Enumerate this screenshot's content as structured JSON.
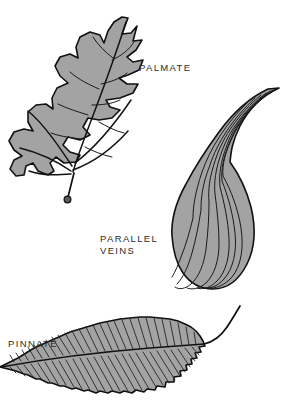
{
  "figure": {
    "width": 284,
    "height": 409,
    "background_color": "#ffffff"
  },
  "colors": {
    "leaf_fill": "#a3a3a3",
    "outline": "#111111",
    "vein": "#1a1a1a",
    "label_text": "#2b2b2b"
  },
  "labels": {
    "palmate": "PALMATE",
    "parallel": "PARALLEL\nVEINS",
    "pinnate": "PINNATE"
  },
  "diagrams": [
    {
      "id": "palmate-leaf",
      "label": "PALMATE",
      "description": "Lobed oak-like leaf with veins radiating from the petiole base into each lobe",
      "margin": "deeply lobed",
      "lobe_count": 9,
      "has_petiole": true
    },
    {
      "id": "parallel-veins-leaf",
      "label": "PARALLEL VEINS",
      "description": "Long lanceolate blade with curved veins running parallel from base to tip",
      "margin": "entire",
      "vein_count": 7,
      "has_petiole": false
    },
    {
      "id": "pinnate-leaf",
      "label": "PINNATE",
      "description": "Elm-like leaf with a central midrib and dense secondary veins branching to a serrated margin",
      "margin": "serrate",
      "secondary_vein_count": 46,
      "has_petiole": true
    }
  ]
}
